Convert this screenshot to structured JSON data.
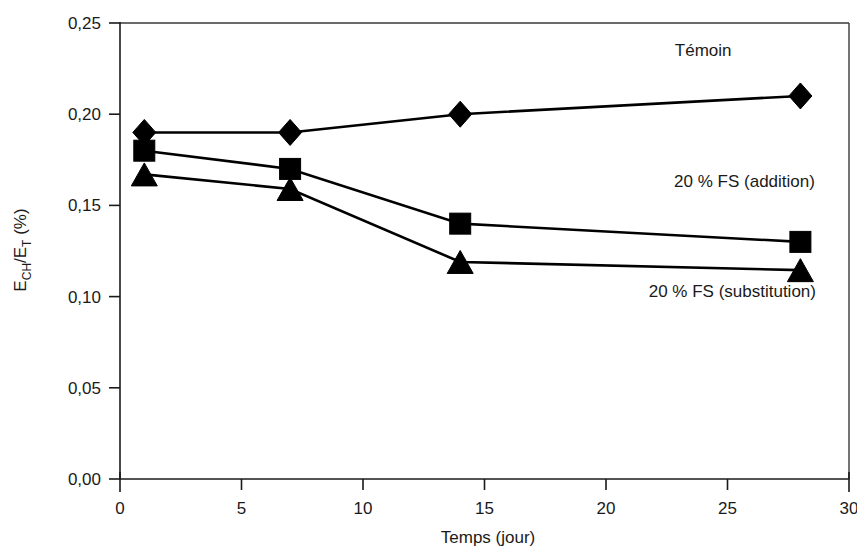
{
  "chart_data": {
    "type": "line",
    "title": "",
    "xlabel": "Temps (jour)",
    "ylabel": "ECH/ET (%)",
    "ylabel_parts": {
      "base1": "E",
      "sub1": "CH",
      "slash": "/E",
      "sub2": "T",
      "unit": " (%)"
    },
    "xlim": [
      0,
      30
    ],
    "ylim": [
      0,
      0.25
    ],
    "xticks": [
      0,
      5,
      10,
      15,
      20,
      25,
      30
    ],
    "xtick_labels": [
      "0",
      "5",
      "10",
      "15",
      "20",
      "25",
      "30"
    ],
    "yticks": [
      0,
      0.05,
      0.1,
      0.15,
      0.2,
      0.25
    ],
    "ytick_labels": [
      "0,00",
      "0,05",
      "0,10",
      "0,15",
      "0,20",
      "0,25"
    ],
    "grid": false,
    "legend_position": "inline-annotations",
    "x": [
      1,
      7,
      14,
      28
    ],
    "series": [
      {
        "name": "Témoin",
        "marker": "diamond",
        "color": "#000000",
        "values": [
          0.19,
          0.19,
          0.2,
          0.21
        ],
        "label_x": 24,
        "label_y": 0.232
      },
      {
        "name": "20 % FS (addition)",
        "marker": "square",
        "color": "#000000",
        "values": [
          0.18,
          0.17,
          0.14,
          0.13
        ],
        "label_x": 25.7,
        "label_y": 0.16
      },
      {
        "name": "20 % FS (substitution)",
        "marker": "triangle",
        "color": "#000000",
        "values": [
          0.167,
          0.159,
          0.119,
          0.1145
        ],
        "label_x": 25.2,
        "label_y": 0.1
      }
    ]
  }
}
